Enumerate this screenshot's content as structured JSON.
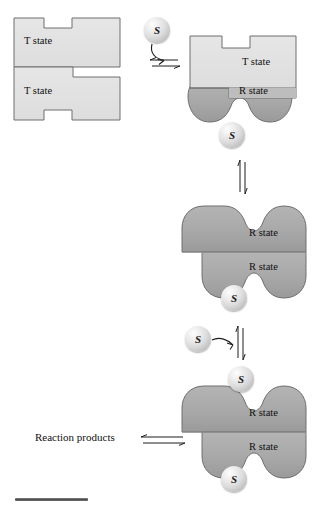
{
  "figure": {
    "type": "allosteric-enzyme-concerted-model-diagram",
    "colors": {
      "t_state_fill": "#e2e2e2",
      "t_state_stroke": "#6b6b6b",
      "r_state_fill": "#a8a8a8",
      "r_state_stroke": "#6b6b6b",
      "r_state_shadow": "#8a8a8a",
      "substrate_ball": "#d8d8d8",
      "text": "#101010",
      "scale_bar": "#4a4a4a"
    }
  },
  "labels": {
    "t_state": "T state",
    "r_state": "R state",
    "substrate": "S",
    "reaction_products": "Reaction products"
  },
  "stages": [
    {
      "id": "stage-1-free-t-state",
      "description": "Free enzyme, both subunits in T state",
      "subunits": [
        {
          "state": "T state",
          "label": "T state"
        },
        {
          "state": "T state",
          "label": "T state"
        }
      ],
      "substrates_bound": 0,
      "free_substrates": 1
    },
    {
      "id": "stage-2-one-substrate-bound",
      "description": "One substrate bound, lower subunit converted to R state",
      "subunits": [
        {
          "state": "T state",
          "label": "T state"
        },
        {
          "state": "R state",
          "label": "R state"
        }
      ],
      "substrates_bound": 1,
      "free_substrates": 0
    },
    {
      "id": "stage-3-both-r-state",
      "description": "Both subunits in R state with one substrate bound",
      "subunits": [
        {
          "state": "R state",
          "label": "R state"
        },
        {
          "state": "R state",
          "label": "R state"
        }
      ],
      "substrates_bound": 1,
      "free_substrates": 1
    },
    {
      "id": "stage-4-both-substrates-bound",
      "description": "Both subunits in R state, both sites occupied by substrate",
      "subunits": [
        {
          "state": "R state",
          "label": "R state"
        },
        {
          "state": "R state",
          "label": "R state"
        }
      ],
      "substrates_bound": 2,
      "free_substrates": 0
    }
  ],
  "arrows": [
    {
      "id": "arrow-stage1-to-stage2",
      "kind": "equilibrium",
      "orientation": "horizontal"
    },
    {
      "id": "arrow-stage2-to-stage3",
      "kind": "equilibrium",
      "orientation": "vertical"
    },
    {
      "id": "arrow-stage3-to-stage4",
      "kind": "equilibrium",
      "orientation": "vertical"
    },
    {
      "id": "arrow-products",
      "kind": "equilibrium",
      "orientation": "horizontal",
      "label": "Reaction products"
    },
    {
      "id": "arrow-substrate-entry-top",
      "kind": "curved-binding"
    },
    {
      "id": "arrow-substrate-entry-lower",
      "kind": "curved-binding"
    }
  ]
}
